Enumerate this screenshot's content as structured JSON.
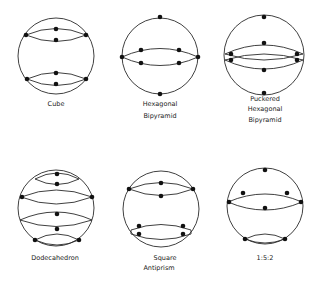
{
  "figure": {
    "stroke_color": "#2a2a2a",
    "dot_color": "#111111",
    "background": "#ffffff",
    "panels": [
      {
        "id": "cube",
        "label_lines": [
          "Cube"
        ],
        "center": [
          56,
          56
        ],
        "r": 38,
        "label_y": [
          103
        ]
      },
      {
        "id": "hexagonal-bipyramid",
        "label_lines": [
          "Hexagonal",
          "Bipyramid"
        ],
        "center": [
          160,
          56
        ],
        "r": 38,
        "label_y": [
          103,
          115
        ]
      },
      {
        "id": "puckered-hexagonal-bipyramid",
        "label_lines": [
          "Puckered",
          "Hexagonal",
          "Bipyramid"
        ],
        "center": [
          264,
          55
        ],
        "r": 40,
        "label_y": [
          97,
          107,
          118
        ]
      },
      {
        "id": "dodecahedron",
        "label_lines": [
          "Dodecahedron"
        ],
        "center": [
          56,
          208
        ],
        "r": 38,
        "label_y": [
          256
        ]
      },
      {
        "id": "square-antiprism",
        "label_lines": [
          "Square",
          "Antiprism"
        ],
        "center": [
          161,
          209
        ],
        "r": 38,
        "label_y": [
          256,
          266
        ]
      },
      {
        "id": "one-five-two",
        "label_lines": [
          "1:5:2"
        ],
        "center": [
          265,
          206
        ],
        "r": 38,
        "label_y": [
          256
        ]
      }
    ]
  }
}
